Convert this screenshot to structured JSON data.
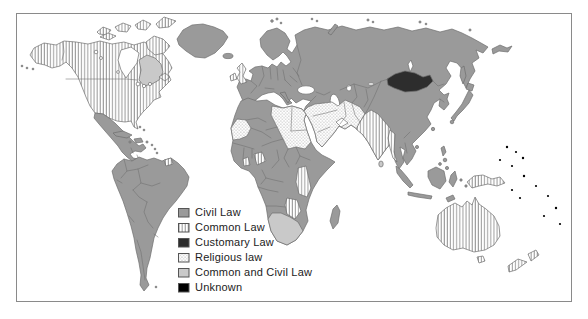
{
  "page": {
    "background": "#ffffff"
  },
  "map": {
    "frame_color": "#8a8a8a",
    "ocean_color": "#ffffff",
    "regions": [
      {
        "name": "Canada",
        "system": "Common Law"
      },
      {
        "name": "Quebec and Labrador",
        "system": "Common and Civil Law"
      },
      {
        "name": "United States",
        "system": "Common Law"
      },
      {
        "name": "Alaska",
        "system": "Common Law"
      },
      {
        "name": "Greenland",
        "system": "Civil Law"
      },
      {
        "name": "Mexico and Central America",
        "system": "Civil Law"
      },
      {
        "name": "Cuba and Caribbean islands",
        "system": "Civil Law"
      },
      {
        "name": "South America",
        "system": "Civil Law"
      },
      {
        "name": "Guyana",
        "system": "Common Law"
      },
      {
        "name": "United Kingdom and Ireland",
        "system": "Common Law"
      },
      {
        "name": "Continental Europe",
        "system": "Civil Law"
      },
      {
        "name": "Russia",
        "system": "Civil Law"
      },
      {
        "name": "Mongolia",
        "system": "Customary Law"
      },
      {
        "name": "China",
        "system": "Civil Law"
      },
      {
        "name": "Japan and Korea",
        "system": "Civil Law"
      },
      {
        "name": "India and Pakistan",
        "system": "Common Law"
      },
      {
        "name": "Myanmar",
        "system": "Common Law"
      },
      {
        "name": "Southeast Asia",
        "system": "Civil Law"
      },
      {
        "name": "Indonesia and Philippines",
        "system": "Civil Law"
      },
      {
        "name": "Middle East and Arabian Peninsula",
        "system": "Religious law"
      },
      {
        "name": "Iran and Afghanistan",
        "system": "Religious law"
      },
      {
        "name": "North Africa (Mauritania, Libya, Egypt, Sudan)",
        "system": "Religious law"
      },
      {
        "name": "West and Central Africa",
        "system": "Civil Law"
      },
      {
        "name": "Nigeria and Ghana",
        "system": "Common Law"
      },
      {
        "name": "East Africa (Kenya, Tanzania, Zambia, Zimbabwe)",
        "system": "Common Law"
      },
      {
        "name": "Southern Africa",
        "system": "Common and Civil Law"
      },
      {
        "name": "Madagascar",
        "system": "Civil Law"
      },
      {
        "name": "Sri Lanka",
        "system": "Common and Civil Law"
      },
      {
        "name": "Australia and New Zealand",
        "system": "Common Law"
      },
      {
        "name": "Papua New Guinea",
        "system": "Common Law"
      },
      {
        "name": "Pacific islands",
        "system": "Unknown"
      }
    ]
  },
  "legend": {
    "items": [
      {
        "label": "Civil Law",
        "key": "civil",
        "swatch": "solid",
        "color": "#9a9a9a"
      },
      {
        "label": "Common Law",
        "key": "common",
        "swatch": "vertical-stripes",
        "color": "#8c8c8c"
      },
      {
        "label": "Customary Law",
        "key": "customary",
        "swatch": "solid",
        "color": "#2d2d2d"
      },
      {
        "label": "Religious law",
        "key": "religious",
        "swatch": "stipple-dots",
        "color": "#8c8c8c"
      },
      {
        "label": "Common and Civil Law",
        "key": "common_civil",
        "swatch": "solid",
        "color": "#c9c9c9"
      },
      {
        "label": "Unknown",
        "key": "unknown",
        "swatch": "solid",
        "color": "#000000"
      }
    ]
  },
  "palette": {
    "civil": "#9a9a9a",
    "common-civil": "#c9c9c9",
    "customary": "#2d2d2d",
    "unknown": "#000000",
    "pattern": "#8c8c8c",
    "line": "#6e6e6e",
    "frame": "#8a8a8a",
    "text": "#1c1c1c"
  }
}
